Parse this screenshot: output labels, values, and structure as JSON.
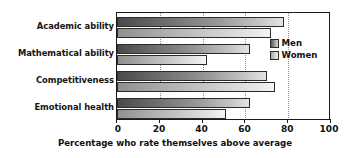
{
  "chart_data": {
    "type": "bar",
    "orientation": "horizontal",
    "title": "",
    "xlabel": "Percentage who rate themselves above average",
    "ylabel": "",
    "categories": [
      "Academic ability",
      "Mathematical ability",
      "Competitiveness",
      "Emotional health"
    ],
    "series": [
      {
        "name": "Men",
        "values": [
          78,
          62,
          70,
          62
        ]
      },
      {
        "name": "Women",
        "values": [
          72,
          42,
          74,
          51
        ]
      }
    ],
    "xlim": [
      0,
      100
    ],
    "xticks": [
      0,
      20,
      40,
      60,
      80,
      100
    ],
    "xtick_labels": [
      "0",
      "20",
      "40",
      "60",
      "80",
      "100"
    ],
    "grid": "vertical-dotted",
    "legend_position": "center-right",
    "colors": {
      "men_bar_dark": "#4a4a4a",
      "men_bar_light": "#e3e3e3",
      "women_bar_dark": "#8f8f8f",
      "women_bar_light": "#f4f4f4",
      "axis": "#1a1a1a",
      "gridline": "#8d8d8d",
      "text": "#101010",
      "background": "#ffffff"
    }
  },
  "legend": {
    "items": [
      {
        "label": "Men"
      },
      {
        "label": "Women"
      }
    ]
  }
}
